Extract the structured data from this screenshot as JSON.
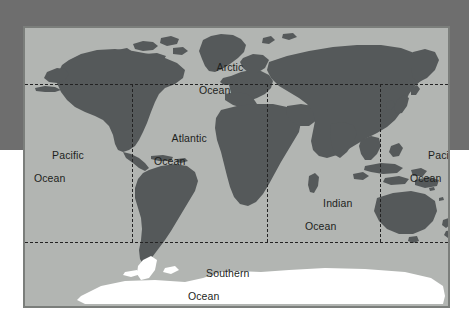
{
  "figure": {
    "kind": "world-ocean-map",
    "title_visible": false
  },
  "colors": {
    "backdrop_gray": "#6e6e6e",
    "page_white": "#ffffff",
    "ocean_fill": "#b2b5b2",
    "land_fill": "#55595a",
    "antarctica_fill": "#ffffff",
    "frame_border": "#7b7e7b",
    "graticule": "#232323",
    "label_text": "#1d1f1d"
  },
  "map": {
    "frame": {
      "x": 23,
      "y": 26,
      "width": 427,
      "height": 282
    },
    "graticule": {
      "style": "dashed",
      "horizontal_lines": [
        {
          "name": "tropic-of-cancer-band",
          "y_px": 56
        },
        {
          "name": "tropic-of-capricorn-band",
          "y_px": 214
        }
      ],
      "vertical_lines": [
        {
          "name": "meridian-west",
          "x_px": 107
        },
        {
          "name": "meridian-center",
          "x_px": 242
        },
        {
          "name": "meridian-east",
          "x_px": 355
        }
      ]
    },
    "labels": [
      {
        "id": "arctic-ocean",
        "line1": "Arctic",
        "line2": "Ocean",
        "x_px": 174,
        "y_px": 22
      },
      {
        "id": "pacific-ocean-west",
        "line1": "Pacific",
        "line2": "Ocean",
        "x_px": 9,
        "y_px": 110
      },
      {
        "id": "atlantic-ocean",
        "line1": "Atlantic",
        "line2": "Ocean",
        "x_px": 129,
        "y_px": 93
      },
      {
        "id": "pacific-ocean-east",
        "line1": "Pacific",
        "line2": "Ocean",
        "x_px": 385,
        "y_px": 110
      },
      {
        "id": "indian-ocean",
        "line1": "Indian",
        "line2": "Ocean",
        "x_px": 280,
        "y_px": 158
      },
      {
        "id": "southern-ocean",
        "line1": "Southern",
        "line2": "Ocean",
        "x_px": 163,
        "y_px": 228
      }
    ]
  }
}
